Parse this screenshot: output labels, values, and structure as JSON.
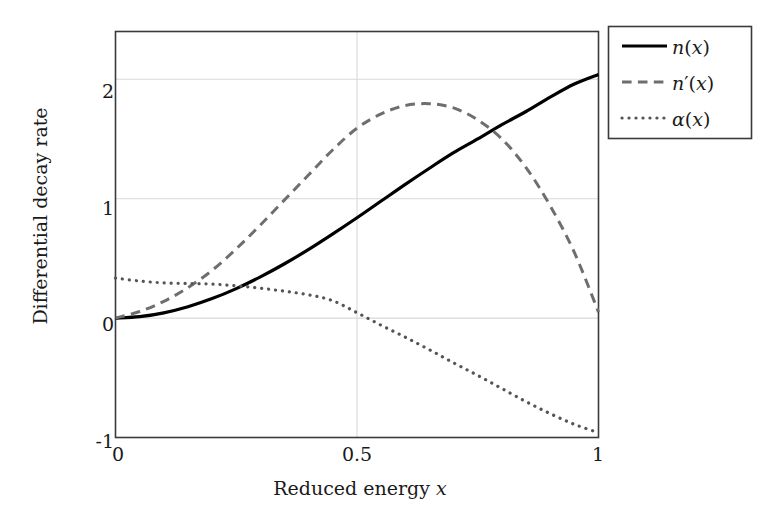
{
  "chart_data": {
    "type": "line",
    "title": "",
    "xlabel": "Reduced energy x",
    "ylabel": "Differential decay rate",
    "xlim": [
      0,
      1
    ],
    "ylim": [
      -1,
      2.4
    ],
    "xticks": [
      "0",
      "0.5",
      "1"
    ],
    "xtick_values": [
      0,
      0.5,
      1
    ],
    "yticks": [
      "2",
      "1",
      "0",
      "-1"
    ],
    "ytick_values": [
      2,
      1,
      0,
      -1
    ],
    "grid": true,
    "grid_color": "#d9d9d9",
    "legend_position": "outside-top-right",
    "x": [
      0,
      0.05,
      0.1,
      0.15,
      0.2,
      0.25,
      0.3,
      0.35,
      0.4,
      0.45,
      0.5,
      0.55,
      0.6,
      0.65,
      0.7,
      0.75,
      0.8,
      0.85,
      0.9,
      0.95,
      1
    ],
    "series": [
      {
        "name": "n(x)",
        "style": "solid",
        "color": "#000000",
        "width": 3.2,
        "values": [
          0.0,
          0.012,
          0.044,
          0.095,
          0.163,
          0.247,
          0.345,
          0.455,
          0.575,
          0.705,
          0.84,
          0.98,
          1.12,
          1.255,
          1.385,
          1.5,
          1.62,
          1.73,
          1.85,
          1.96,
          2.04
        ]
      },
      {
        "name": "n'(x)",
        "style": "dashed",
        "color": "#6e6e6e",
        "width": 3.0,
        "values": [
          0.0,
          0.055,
          0.14,
          0.255,
          0.4,
          0.58,
          0.78,
          0.99,
          1.2,
          1.41,
          1.59,
          1.71,
          1.78,
          1.795,
          1.76,
          1.66,
          1.5,
          1.26,
          0.94,
          0.55,
          0.05
        ]
      },
      {
        "name": "α(x)",
        "style": "dotted",
        "color": "#555555",
        "width": 3.2,
        "values": [
          0.335,
          0.31,
          0.295,
          0.29,
          0.285,
          0.27,
          0.25,
          0.225,
          0.195,
          0.145,
          0.045,
          -0.06,
          -0.16,
          -0.265,
          -0.375,
          -0.48,
          -0.59,
          -0.7,
          -0.8,
          -0.89,
          -0.96
        ]
      }
    ],
    "legend_entries": [
      {
        "label": "n(x)",
        "style": "solid",
        "color": "#000000"
      },
      {
        "label": "n'(x)",
        "style": "dashed",
        "color": "#6e6e6e"
      },
      {
        "label": "α(x)",
        "style": "dotted",
        "color": "#555555"
      }
    ]
  },
  "axes": {
    "xlabel": "Reduced energy x",
    "ylabel": "Differential decay rate",
    "xtick_labels": [
      "0",
      "0.5",
      "1"
    ],
    "ytick_labels": [
      "2",
      "1",
      "0",
      "-1"
    ]
  },
  "legend": {
    "item0_label": "n(x)",
    "item1_label": "n'(x)",
    "item2_label": "α(x)"
  },
  "colors": {
    "frame": "#3a3a3a",
    "grid": "#dcdcdc",
    "solid_series": "#000000",
    "dashed_series": "#6e6e6e",
    "dotted_series": "#555555",
    "text": "#1a1a1a",
    "background": "#ffffff"
  }
}
